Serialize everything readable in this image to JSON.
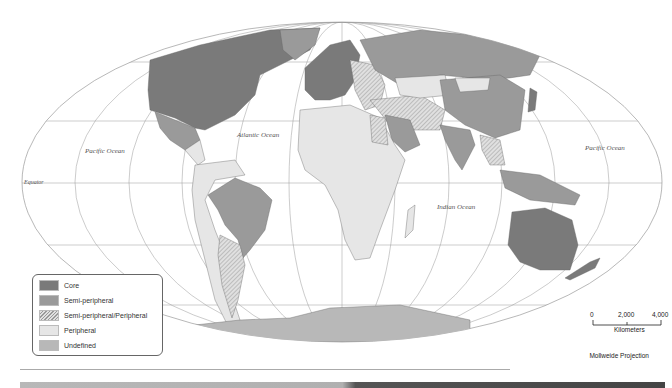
{
  "map": {
    "title": "World-System: Core, Semi-periphery, Periphery",
    "projection": "Mollweide Projection",
    "labels": {
      "pacific_west": "Pacific Ocean",
      "atlantic": "Atlantic Ocean",
      "indian": "Indian Ocean",
      "pacific_east": "Pacific Ocean",
      "equator": "Equator"
    },
    "colors": {
      "core": "#7a7a7a",
      "semi_peripheral": "#9a9a9a",
      "peripheral": "#e6e6e6",
      "undefined": "#b8b8b8",
      "ocean": "#ffffff",
      "graticule": "#999999"
    }
  },
  "legend": {
    "items": [
      {
        "label": "Core",
        "color": "#7a7a7a",
        "pattern": "solid"
      },
      {
        "label": "Semi-peripheral",
        "color": "#9a9a9a",
        "pattern": "solid"
      },
      {
        "label": "Semi-peripheral/Peripheral",
        "color": "#d0d0d0",
        "pattern": "hatched"
      },
      {
        "label": "Peripheral",
        "color": "#e6e6e6",
        "pattern": "solid"
      },
      {
        "label": "Undefined",
        "color": "#b8b8b8",
        "pattern": "solid"
      }
    ]
  },
  "scale": {
    "ticks": [
      "0",
      "2,000",
      "4,000"
    ],
    "unit": "Kilometers"
  }
}
